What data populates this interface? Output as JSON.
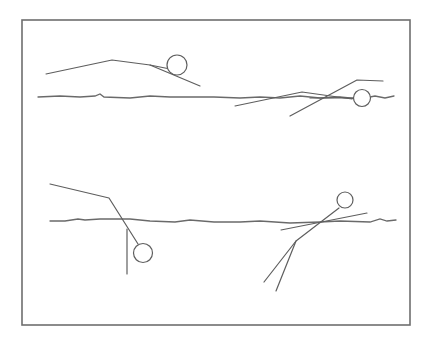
{
  "diagram": {
    "title": "",
    "frame": {
      "x": 22,
      "y": 20,
      "width": 388,
      "height": 305,
      "color": "#6e6e6e"
    },
    "water_lines": [
      {
        "name": "upper-water-surface",
        "points": [
          [
            38,
            97
          ],
          [
            60,
            96
          ],
          [
            80,
            97
          ],
          [
            95,
            96
          ],
          [
            100,
            94
          ],
          [
            104,
            97
          ],
          [
            130,
            98
          ],
          [
            150,
            96
          ],
          [
            170,
            97
          ],
          [
            195,
            97
          ],
          [
            214,
            97
          ],
          [
            240,
            98
          ],
          [
            260,
            97
          ],
          [
            280,
            98
          ],
          [
            300,
            96
          ],
          [
            320,
            98
          ],
          [
            340,
            97
          ],
          [
            360,
            99
          ],
          [
            375,
            96
          ],
          [
            385,
            98
          ],
          [
            394,
            96
          ]
        ]
      },
      {
        "name": "lower-water-surface",
        "points": [
          [
            50,
            221
          ],
          [
            65,
            221
          ],
          [
            78,
            219
          ],
          [
            85,
            220
          ],
          [
            100,
            219
          ],
          [
            130,
            219
          ],
          [
            150,
            221
          ],
          [
            175,
            222
          ],
          [
            190,
            220
          ],
          [
            214,
            222
          ],
          [
            240,
            222
          ],
          [
            260,
            221
          ],
          [
            290,
            223
          ],
          [
            320,
            222
          ],
          [
            340,
            221
          ],
          [
            370,
            222
          ],
          [
            380,
            219
          ],
          [
            387,
            221
          ],
          [
            396,
            220
          ]
        ]
      }
    ],
    "figures": [
      {
        "name": "figure-floating-prone",
        "head": {
          "cx": 177,
          "cy": 65,
          "r": 10
        },
        "limbs": [
          [
            [
              46,
              74
            ],
            [
              112,
              60
            ],
            [
              150,
              65
            ],
            [
              200,
              86
            ]
          ],
          [
            [
              150,
              65
            ],
            [
              170,
              69
            ]
          ]
        ]
      },
      {
        "name": "figure-swimming-surface",
        "head": {
          "cx": 362,
          "cy": 98,
          "r": 8.5
        },
        "limbs": [
          [
            [
              235,
              106
            ],
            [
              302,
              92
            ],
            [
              352,
              99
            ]
          ],
          [
            [
              290,
              116
            ],
            [
              357,
              80
            ],
            [
              383,
              81
            ]
          ],
          [
            [
              310,
              98
            ],
            [
              355,
              98
            ]
          ]
        ]
      },
      {
        "name": "figure-diving-head-down",
        "head": {
          "cx": 143,
          "cy": 253,
          "r": 9.5
        },
        "limbs": [
          [
            [
              50,
              184
            ],
            [
              109,
              198
            ],
            [
              138,
              244
            ]
          ],
          [
            [
              127,
              229
            ],
            [
              127,
              274
            ]
          ]
        ]
      },
      {
        "name": "figure-treading-vertical",
        "head": {
          "cx": 345,
          "cy": 200,
          "r": 8
        },
        "limbs": [
          [
            [
              339,
              208
            ],
            [
              296,
              241
            ],
            [
              264,
              282
            ]
          ],
          [
            [
              296,
              241
            ],
            [
              276,
              291
            ]
          ],
          [
            [
              281,
              230
            ],
            [
              367,
              213
            ]
          ]
        ]
      }
    ],
    "stroke_color": "#5e5e5e"
  }
}
